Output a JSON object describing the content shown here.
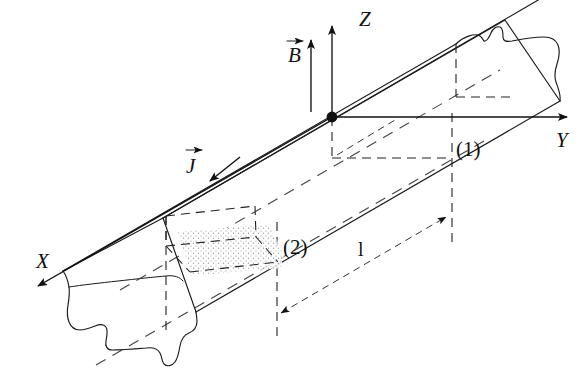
{
  "figure": {
    "background_color": "#ffffff",
    "line_color": "#1a1a1a",
    "dotted_fill_color": "#8a8a8a"
  },
  "axes": {
    "x": {
      "label": "X",
      "x": 36,
      "y": 268,
      "description": "axis toward lower-left, arrowhead at far end"
    },
    "y": {
      "label": "Y",
      "x": 556,
      "y": 147,
      "description": "horizontal axis to the right, arrowhead at far end"
    },
    "z": {
      "label": "Z",
      "x": 359,
      "y": 26,
      "description": "vertical axis upward, arrowhead at top"
    },
    "origin": {
      "x": 332,
      "y": 117,
      "marker": "filled-dot"
    }
  },
  "vectors": [
    {
      "name": "magnetic-field",
      "label": "B",
      "arrow_glyph": "→",
      "label_x": 288,
      "label_y": 62,
      "shaft_x": 311,
      "shaft_top": 40,
      "shaft_bottom": 112
    },
    {
      "name": "current-density",
      "label": "J",
      "arrow_glyph": "→",
      "label_x": 186,
      "label_y": 173,
      "tip_x": 213,
      "tip_y": 180
    }
  ],
  "section_labels": [
    {
      "name": "section-one",
      "text": "(1)",
      "x": 459,
      "y": 149
    },
    {
      "name": "section-two",
      "text": "(2)",
      "x": 285,
      "y": 247
    }
  ],
  "dimension": {
    "name": "length",
    "label": "l",
    "label_x": 362,
    "label_y": 253,
    "from": {
      "x": 281,
      "y": 313
    },
    "to": {
      "x": 446,
      "y": 217
    },
    "style": "double-headed-dashed-arrow"
  },
  "bar": {
    "description": "long rectangular bar drawn in oblique projection running along the Y axis, with torn/broken ends at both extremities",
    "torn_end_left": true,
    "torn_end_right": true,
    "highlighted_slab": {
      "name": "dotted-cross-section-slab",
      "description": "stippled parallelepiped slice between sections near label (2)",
      "fill": "dotted"
    }
  }
}
